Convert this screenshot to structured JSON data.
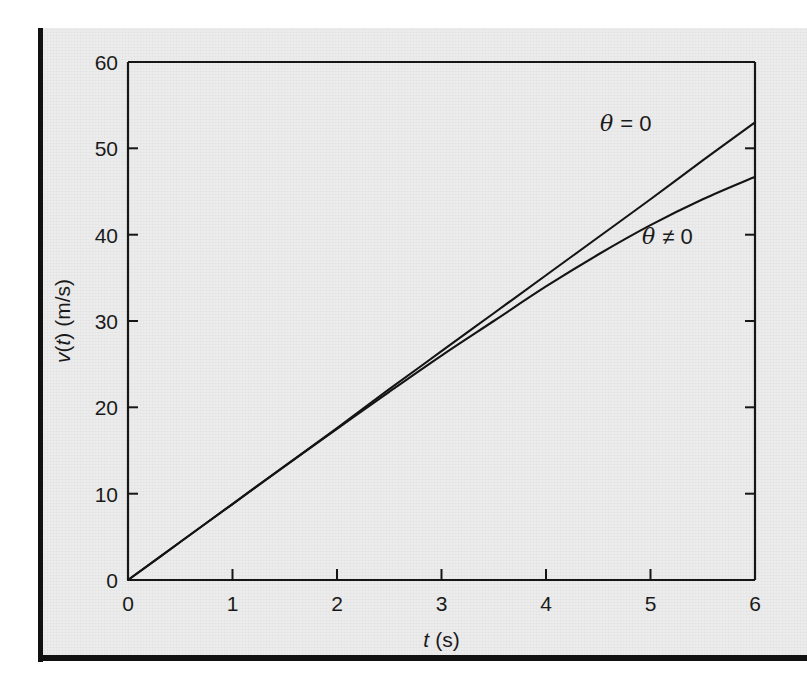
{
  "figure": {
    "background_color": "#ececec",
    "ink_color": "#161616",
    "edge_border_color": "#111111"
  },
  "chart_data": {
    "type": "line",
    "title": "",
    "xlabel": "t (s)",
    "xlabel_symbol": "t",
    "xlabel_unit": "(s)",
    "ylabel": "v(t) (m/s)",
    "ylabel_symbol": "v",
    "ylabel_arg": "t",
    "ylabel_unit": "(m/s)",
    "xlim": [
      0,
      6
    ],
    "ylim": [
      0,
      60
    ],
    "xticks": [
      0,
      1,
      2,
      3,
      4,
      5,
      6
    ],
    "xtick_labels": [
      "0",
      "1",
      "2",
      "3",
      "4",
      "5",
      "6"
    ],
    "yticks": [
      0,
      10,
      20,
      30,
      40,
      50,
      60
    ],
    "ytick_labels": [
      "0",
      "10",
      "20",
      "30",
      "40",
      "50",
      "60"
    ],
    "grid": false,
    "legend_position": "inline-annotation",
    "annotations": [
      {
        "text": "θ = 0",
        "x": 4.55,
        "y": 52.0
      },
      {
        "text": "θ ≠ 0",
        "x": 4.95,
        "y": 39.5
      }
    ],
    "series": [
      {
        "name": "θ = 0",
        "label": "theta-equals-zero",
        "x": [
          0,
          0.5,
          1,
          1.5,
          2,
          2.5,
          3,
          3.5,
          4,
          4.5,
          5,
          5.5,
          6
        ],
        "values": [
          0,
          4.4,
          8.8,
          13.2,
          17.6,
          22.1,
          26.5,
          30.9,
          35.3,
          39.7,
          44.1,
          48.6,
          53.0
        ]
      },
      {
        "name": "θ ≠ 0",
        "label": "theta-not-zero",
        "x": [
          0,
          0.5,
          1,
          1.5,
          2,
          2.5,
          3,
          3.5,
          4,
          4.5,
          5,
          5.5,
          6
        ],
        "values": [
          0,
          4.4,
          8.8,
          13.2,
          17.5,
          21.8,
          26.0,
          30.0,
          34.0,
          37.7,
          41.1,
          44.1,
          46.7
        ]
      }
    ]
  }
}
